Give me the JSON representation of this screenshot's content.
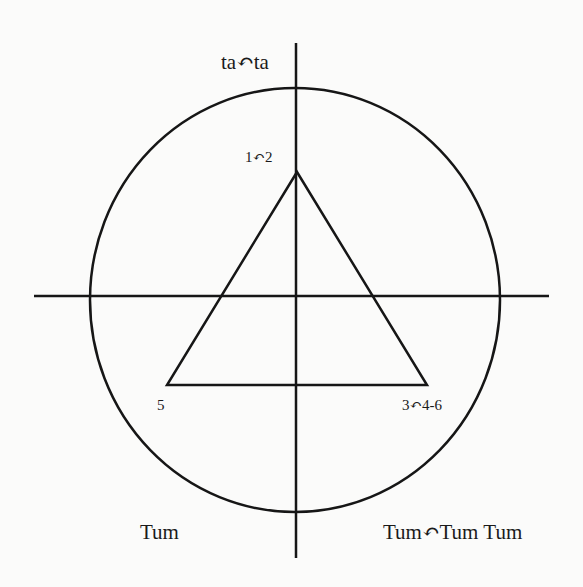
{
  "diagram": {
    "colors": {
      "stroke": "#161616",
      "background": "#fbfbfa",
      "text": "#1a1a1a"
    },
    "axes": {
      "horizontal": {
        "x1": 34,
        "y1": 296,
        "x2": 549,
        "y2": 296
      },
      "vertical": {
        "x1": 296,
        "y1": 43,
        "x2": 296,
        "y2": 558
      }
    },
    "circle": {
      "cx": 295,
      "cy": 300,
      "rx": 205,
      "ry": 212
    },
    "triangle": {
      "points": "297,172 167,385 427,385"
    },
    "labels": {
      "top": "ta↶ta",
      "apex": "1↶2",
      "left_vertex": "5",
      "right_vertex": "3↶4-6",
      "bottom_left": "Tum",
      "bottom_right": "Tum↶Tum Tum"
    }
  }
}
